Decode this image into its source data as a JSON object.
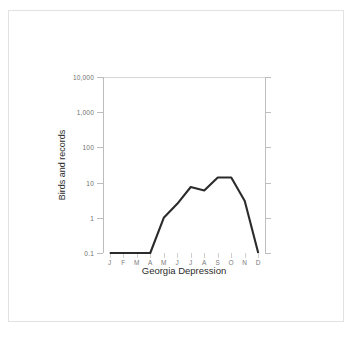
{
  "figure": {
    "frame_color": "#e2e2e2",
    "background": "#ffffff"
  },
  "chart_data": {
    "type": "line",
    "title": "",
    "xlabel": "Georgia Depression",
    "ylabel": "Birds and records",
    "yscale": "log",
    "ylim": [
      0.1,
      10000
    ],
    "grid": "single gridline at top (10,000)",
    "legend": "none",
    "line_color": "#2b2b2b",
    "categories": [
      "J",
      "F",
      "M",
      "A",
      "M",
      "J",
      "J",
      "A",
      "S",
      "O",
      "N",
      "D"
    ],
    "month_names": [
      "January",
      "February",
      "March",
      "April",
      "May",
      "June",
      "July",
      "August",
      "September",
      "October",
      "November",
      "December"
    ],
    "values": [
      0.1,
      0.1,
      0.1,
      0.1,
      1.0,
      2.5,
      7.5,
      6.0,
      14.0,
      14.0,
      3.0,
      0.1
    ],
    "ytick_labels": [
      "0.1",
      "1",
      "10",
      "100",
      "1,000",
      "10,000"
    ],
    "ytick_values": [
      0.1,
      1,
      10,
      100,
      1000,
      10000
    ],
    "series": [
      {
        "name": "Birds and records",
        "values": [
          0.1,
          0.1,
          0.1,
          0.1,
          1.0,
          2.5,
          7.5,
          6.0,
          14.0,
          14.0,
          3.0,
          0.1
        ]
      }
    ]
  }
}
